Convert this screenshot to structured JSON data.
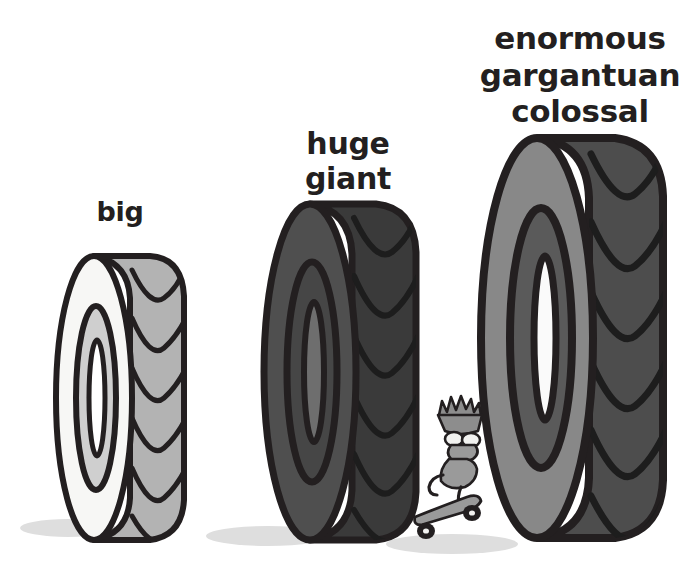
{
  "canvas": {
    "width": 700,
    "height": 563,
    "background": "#ffffff"
  },
  "labels": {
    "small": "big",
    "medium": "huge\ngiant",
    "large": "enormous\ngargantuan\ncolossal"
  },
  "palette": {
    "outline": "#231f20",
    "text": "#231f20",
    "background": "#ffffff",
    "tire1_sidewall": "#f7f7f5",
    "tire1_tread": "#b3b3b3",
    "tire1_hub": "#d0d0d0",
    "tire2_sidewall": "#4f4f4f",
    "tire2_tread": "#3a3a3a",
    "tire2_hub": "#4f4f4f",
    "tire3_sidewall": "#888888",
    "tire3_tread": "#4d4d4d",
    "tire3_hub": "#5a5a5a",
    "shadow": "#dcdcdc",
    "skater_body": "#f2f2f0",
    "skater_skin": "#8d8d8d",
    "skater_board": "#9a9a9a"
  },
  "objects": [
    {
      "name": "tire-small",
      "label": "big",
      "order": 1,
      "relative_size": "small"
    },
    {
      "name": "tire-medium",
      "label": "huge giant",
      "order": 2,
      "relative_size": "medium"
    },
    {
      "name": "tire-large",
      "label": "enormous gargantuan colossal",
      "order": 3,
      "relative_size": "large"
    },
    {
      "name": "skateboarder",
      "label": "",
      "order": 4,
      "relative_size": "tiny"
    }
  ],
  "icon_names": {
    "tire": "tire-icon",
    "skateboard": "skateboard-icon",
    "character": "skater-character-icon",
    "shadow": "drop-shadow"
  }
}
